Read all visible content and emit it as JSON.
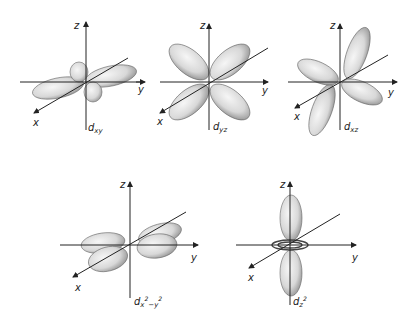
{
  "figure": {
    "orbitals": [
      {
        "id": "dxy",
        "label_main": "d",
        "label_sub": "xy",
        "axes": {
          "x": "x",
          "y": "y",
          "z": "z"
        }
      },
      {
        "id": "dyz",
        "label_main": "d",
        "label_sub": "yz",
        "axes": {
          "x": "x",
          "y": "y",
          "z": "z"
        },
        "extra_left_axis": "y"
      },
      {
        "id": "dxz",
        "label_main": "d",
        "label_sub": "xz",
        "axes": {
          "x": "x",
          "y": "y",
          "z": "z"
        }
      },
      {
        "id": "dx2-y2",
        "label_main": "d",
        "label_sub": "x",
        "label_sup1": "2",
        "label_sub2": "−y",
        "label_sup2": "2",
        "axes": {
          "x": "x",
          "y": "y",
          "z": "z"
        }
      },
      {
        "id": "dz2",
        "label_main": "d",
        "label_sub": "z",
        "label_sup": "2",
        "axes": {
          "x": "x",
          "y": "y",
          "z": "z"
        }
      }
    ],
    "colors": {
      "lobe_fill": "#e9e9e9",
      "lobe_shade": "#9a9a9a",
      "axis": "#222222"
    }
  }
}
